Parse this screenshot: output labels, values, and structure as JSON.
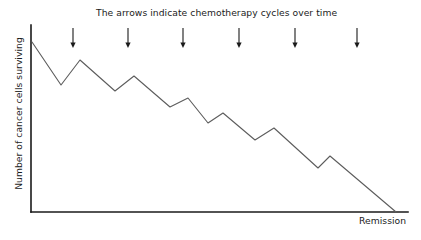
{
  "figure": {
    "caption": "The arrows indicate chemotherapy cycles over time",
    "ylabel": "Number of cancer cells surviving",
    "endpoint_label": "Remission"
  },
  "colors": {
    "axis": "#1a1a1a",
    "curve": "#5c5c5c",
    "arrow": "#1a1a1a",
    "text": "#1b1b1b",
    "background": "#ffffff"
  },
  "chart_data": {
    "type": "line",
    "title": "The arrows indicate chemotherapy cycles over time",
    "xlabel": "",
    "ylabel": "Number of cancer cells surviving",
    "grid": false,
    "legend": false,
    "axis_ticks": [],
    "xlim": [
      31,
      400
    ],
    "ylim": [
      212,
      25
    ],
    "annotations": [
      {
        "text": "Remission",
        "x": 359,
        "y": 215
      },
      {
        "text": "The arrows indicate chemotherapy cycles over time",
        "x": 96,
        "y": 7
      }
    ],
    "axes": {
      "y_axis": {
        "x": 31,
        "y_top": 25,
        "y_bottom": 212
      },
      "x_axis": {
        "y": 212,
        "x_left": 31,
        "x_right": 408
      }
    },
    "arrows": {
      "count": 6,
      "y_top": 28,
      "y_bottom": 48,
      "x_positions": [
        73,
        128,
        183,
        239,
        295,
        357
      ]
    },
    "series": [
      {
        "name": "Number of cancer cells surviving",
        "points": [
          [
            32,
            42
          ],
          [
            61,
            85
          ],
          [
            80,
            60
          ],
          [
            115,
            91
          ],
          [
            134,
            76
          ],
          [
            170,
            107
          ],
          [
            188,
            98
          ],
          [
            208,
            123
          ],
          [
            223,
            113
          ],
          [
            255,
            140
          ],
          [
            274,
            128
          ],
          [
            318,
            168
          ],
          [
            330,
            156
          ],
          [
            396,
            212
          ]
        ]
      }
    ]
  }
}
